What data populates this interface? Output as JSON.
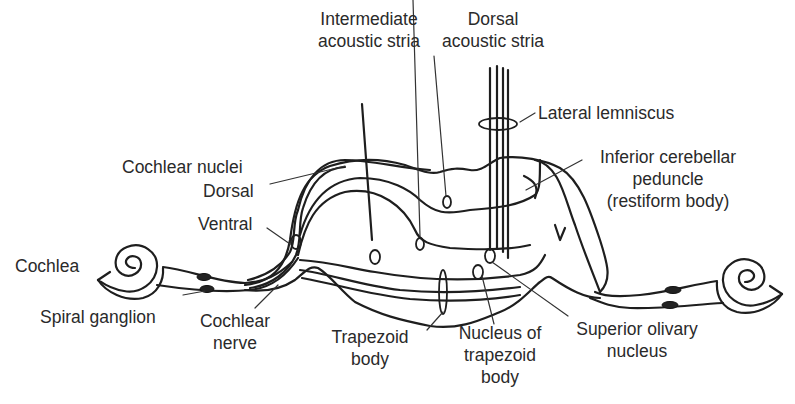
{
  "diagram": {
    "labels": {
      "intermediate_stria": [
        "Intermediate",
        "acoustic stria"
      ],
      "dorsal_stria": [
        "Dorsal",
        "acoustic stria"
      ],
      "lateral_lemniscus": "Lateral lemniscus",
      "cochlear_nuclei": "Cochlear nuclei",
      "dorsal": "Dorsal",
      "ventral": "Ventral",
      "inferior_cerebellar_peduncle": [
        "Inferior cerebellar",
        "peduncle",
        "(restiform body)"
      ],
      "cochlea": "Cochlea",
      "spiral_ganglion": "Spiral ganglion",
      "cochlear_nerve": [
        "Cochlear",
        "nerve"
      ],
      "trapezoid_body": [
        "Trapezoid",
        "body"
      ],
      "nucleus_of_trapezoid_body": [
        "Nucleus of",
        "trapezoid",
        "body"
      ],
      "superior_olivary_nucleus": [
        "Superior olivary",
        "nucleus"
      ]
    },
    "colors": {
      "line": "#1e1e1e",
      "text": "#2a2a2a",
      "background": "#ffffff"
    }
  }
}
